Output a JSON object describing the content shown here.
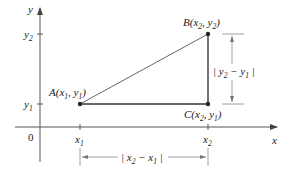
{
  "diagram": {
    "colors": {
      "axis": "#555555",
      "line": "#666666",
      "point": "#222222",
      "text": "#222222"
    },
    "axes": {
      "x_label": "x",
      "y_label": "y",
      "origin_label": "0",
      "x_ticks": [
        {
          "base": "x",
          "sub": "1"
        },
        {
          "base": "x",
          "sub": "2"
        }
      ],
      "y_ticks": [
        {
          "base": "y",
          "sub": "1"
        },
        {
          "base": "y",
          "sub": "2"
        }
      ]
    },
    "points": [
      {
        "name": "A",
        "coords_text": "A(x1, y1)"
      },
      {
        "name": "B",
        "coords_text": "B(x2, y2)"
      },
      {
        "name": "C",
        "coords_text": "C(x2, y1)"
      }
    ],
    "dimensions": {
      "vertical": "|y2 − y1|",
      "horizontal": "|x2 − x1|"
    }
  }
}
